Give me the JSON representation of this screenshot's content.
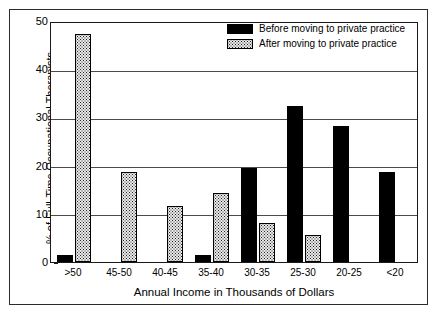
{
  "chart_data": {
    "type": "bar",
    "title": "",
    "xlabel": "Annual Income in Thousands of Dollars",
    "ylabel": "% of Full-Time Occupational Therapists",
    "categories": [
      ">50",
      "45-50",
      "40-45",
      "35-40",
      "30-35",
      "25-30",
      "20-25",
      "<20"
    ],
    "series": [
      {
        "name": "Before moving to private practice",
        "style": "solid-black",
        "values": [
          1.5,
          0,
          0,
          1.5,
          19.6,
          32.3,
          28.3,
          18.7
        ]
      },
      {
        "name": "After moving to private practice",
        "style": "dotted-gray",
        "values": [
          47.3,
          18.6,
          11.7,
          14.4,
          8.0,
          5.7,
          0,
          0
        ]
      }
    ],
    "ylim": [
      0,
      50
    ],
    "yticks": [
      0,
      10,
      20,
      30,
      40,
      50
    ],
    "ytick_labels": [
      "0",
      "10",
      "20",
      "30",
      "40",
      "50"
    ],
    "grid": "horizontal",
    "legend_position": "top-right"
  },
  "axes": {
    "y_title": "% of Full-Time Occupational Therapists",
    "x_title": "Annual Income in Thousands of Dollars"
  },
  "legend": {
    "entries": [
      {
        "label": "Before moving to private practice",
        "swatch": "solid-black-swatch"
      },
      {
        "label": "After moving to private practice",
        "swatch": "dotted-gray-swatch"
      }
    ]
  },
  "colors": {
    "series_before": "#000000",
    "series_after": "#e9e9e9",
    "gridline": "#4a4a4a",
    "frame": "#2b2b2b",
    "background": "#ffffff"
  }
}
